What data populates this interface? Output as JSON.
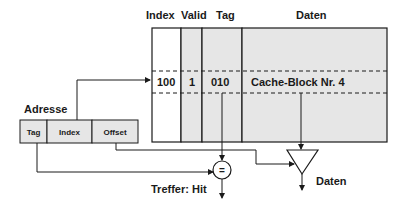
{
  "table": {
    "headers": {
      "index": "Index",
      "valid": "Valid",
      "tag": "Tag",
      "data": "Daten"
    },
    "row": {
      "index": "100",
      "valid": "1",
      "tag": "010",
      "data": "Cache-Block Nr. 4"
    }
  },
  "address": {
    "label": "Adresse",
    "fields": [
      "Tag",
      "Index",
      "Offset"
    ]
  },
  "comparator": {
    "symbol": "="
  },
  "outputs": {
    "hit_label": "Treffer: Hit",
    "data_label": "Daten"
  },
  "colors": {
    "cell_fill": "#e6e6e6",
    "line": "#1a1a1a",
    "background": "#ffffff"
  }
}
